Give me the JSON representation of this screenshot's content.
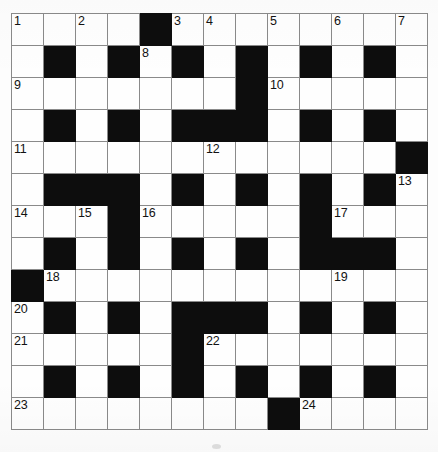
{
  "puzzle": {
    "type": "crossword-grid",
    "rows": 13,
    "cols": 13,
    "cell_size_px": 32,
    "colors": {
      "block": "#0d0d0d",
      "open": "#fefefe",
      "grid_line": "#8a8a8a",
      "outer_border": "#5c5c5c",
      "number_text": "#121212"
    },
    "numbers_across_and_down": [
      1,
      2,
      3,
      4,
      5,
      6,
      7,
      8,
      9,
      10,
      11,
      12,
      13,
      14,
      15,
      16,
      17,
      18,
      19,
      20,
      21,
      22,
      23,
      24
    ],
    "grid": [
      [
        "open",
        "open",
        "open",
        "open",
        "block",
        "open",
        "open",
        "open",
        "open",
        "open",
        "open",
        "open",
        "open"
      ],
      [
        "open",
        "block",
        "open",
        "block",
        "open",
        "block",
        "open",
        "block",
        "open",
        "block",
        "open",
        "block",
        "open"
      ],
      [
        "open",
        "open",
        "open",
        "open",
        "open",
        "open",
        "open",
        "block",
        "open",
        "open",
        "open",
        "open",
        "open"
      ],
      [
        "open",
        "block",
        "open",
        "block",
        "open",
        "block",
        "block",
        "block",
        "open",
        "block",
        "open",
        "block",
        "open"
      ],
      [
        "open",
        "open",
        "open",
        "open",
        "open",
        "open",
        "open",
        "open",
        "open",
        "open",
        "open",
        "open",
        "block"
      ],
      [
        "open",
        "block",
        "block",
        "block",
        "open",
        "block",
        "open",
        "block",
        "open",
        "block",
        "open",
        "block",
        "open"
      ],
      [
        "open",
        "open",
        "open",
        "block",
        "open",
        "open",
        "open",
        "open",
        "open",
        "block",
        "open",
        "open",
        "open"
      ],
      [
        "open",
        "block",
        "open",
        "block",
        "open",
        "block",
        "open",
        "block",
        "open",
        "block",
        "block",
        "block",
        "open"
      ],
      [
        "block",
        "open",
        "open",
        "open",
        "open",
        "open",
        "open",
        "open",
        "open",
        "open",
        "open",
        "open",
        "open"
      ],
      [
        "open",
        "block",
        "open",
        "block",
        "open",
        "block",
        "block",
        "block",
        "open",
        "block",
        "open",
        "block",
        "open"
      ],
      [
        "open",
        "open",
        "open",
        "open",
        "open",
        "block",
        "open",
        "open",
        "open",
        "open",
        "open",
        "open",
        "open"
      ],
      [
        "open",
        "block",
        "open",
        "block",
        "open",
        "block",
        "open",
        "block",
        "open",
        "block",
        "open",
        "block",
        "open"
      ],
      [
        "open",
        "open",
        "open",
        "open",
        "open",
        "open",
        "open",
        "open",
        "block",
        "open",
        "open",
        "open",
        "open"
      ]
    ],
    "cell_numbers": [
      [
        1,
        null,
        2,
        null,
        null,
        3,
        4,
        null,
        5,
        null,
        6,
        null,
        7
      ],
      [
        null,
        null,
        null,
        null,
        8,
        null,
        null,
        null,
        null,
        null,
        null,
        null,
        null
      ],
      [
        9,
        null,
        null,
        null,
        null,
        null,
        null,
        null,
        10,
        null,
        null,
        null,
        null
      ],
      [
        null,
        null,
        null,
        null,
        null,
        null,
        null,
        null,
        null,
        null,
        null,
        null,
        null
      ],
      [
        11,
        null,
        null,
        null,
        null,
        null,
        12,
        null,
        null,
        null,
        null,
        null,
        null
      ],
      [
        null,
        null,
        null,
        null,
        null,
        null,
        null,
        null,
        null,
        null,
        null,
        null,
        13
      ],
      [
        14,
        null,
        15,
        null,
        16,
        null,
        null,
        null,
        null,
        null,
        17,
        null,
        null
      ],
      [
        null,
        null,
        null,
        null,
        null,
        null,
        null,
        null,
        null,
        null,
        null,
        null,
        null
      ],
      [
        null,
        18,
        null,
        null,
        null,
        null,
        null,
        null,
        null,
        null,
        19,
        null,
        null
      ],
      [
        20,
        null,
        null,
        null,
        null,
        null,
        null,
        null,
        null,
        null,
        null,
        null,
        null
      ],
      [
        21,
        null,
        null,
        null,
        null,
        null,
        22,
        null,
        null,
        null,
        null,
        null,
        null
      ],
      [
        null,
        null,
        null,
        null,
        null,
        null,
        null,
        null,
        null,
        null,
        null,
        null,
        null
      ],
      [
        23,
        null,
        null,
        null,
        null,
        null,
        null,
        null,
        null,
        24,
        null,
        null,
        null
      ]
    ],
    "letters": [
      [
        null,
        null,
        null,
        null,
        null,
        null,
        null,
        null,
        null,
        null,
        null,
        null,
        null
      ],
      [
        null,
        null,
        null,
        null,
        null,
        null,
        null,
        null,
        null,
        null,
        null,
        null,
        null
      ],
      [
        null,
        null,
        null,
        null,
        null,
        null,
        null,
        null,
        null,
        null,
        null,
        null,
        null
      ],
      [
        null,
        null,
        null,
        null,
        null,
        null,
        null,
        null,
        null,
        null,
        null,
        null,
        null
      ],
      [
        null,
        null,
        null,
        null,
        null,
        null,
        null,
        null,
        null,
        null,
        null,
        null,
        null
      ],
      [
        null,
        null,
        null,
        null,
        null,
        null,
        null,
        null,
        null,
        null,
        null,
        null,
        null
      ],
      [
        null,
        null,
        null,
        null,
        null,
        null,
        null,
        null,
        null,
        null,
        null,
        null,
        null
      ],
      [
        null,
        null,
        null,
        null,
        null,
        null,
        null,
        null,
        null,
        null,
        null,
        null,
        null
      ],
      [
        null,
        null,
        null,
        null,
        null,
        null,
        null,
        null,
        null,
        null,
        null,
        null,
        null
      ],
      [
        null,
        null,
        null,
        null,
        null,
        null,
        null,
        null,
        null,
        null,
        null,
        null,
        null
      ],
      [
        null,
        null,
        null,
        null,
        null,
        null,
        null,
        null,
        null,
        null,
        null,
        null,
        null
      ],
      [
        null,
        null,
        null,
        null,
        null,
        null,
        null,
        null,
        null,
        null,
        null,
        null,
        null
      ],
      [
        null,
        null,
        null,
        null,
        null,
        null,
        null,
        null,
        null,
        null,
        null,
        null,
        null
      ]
    ]
  }
}
